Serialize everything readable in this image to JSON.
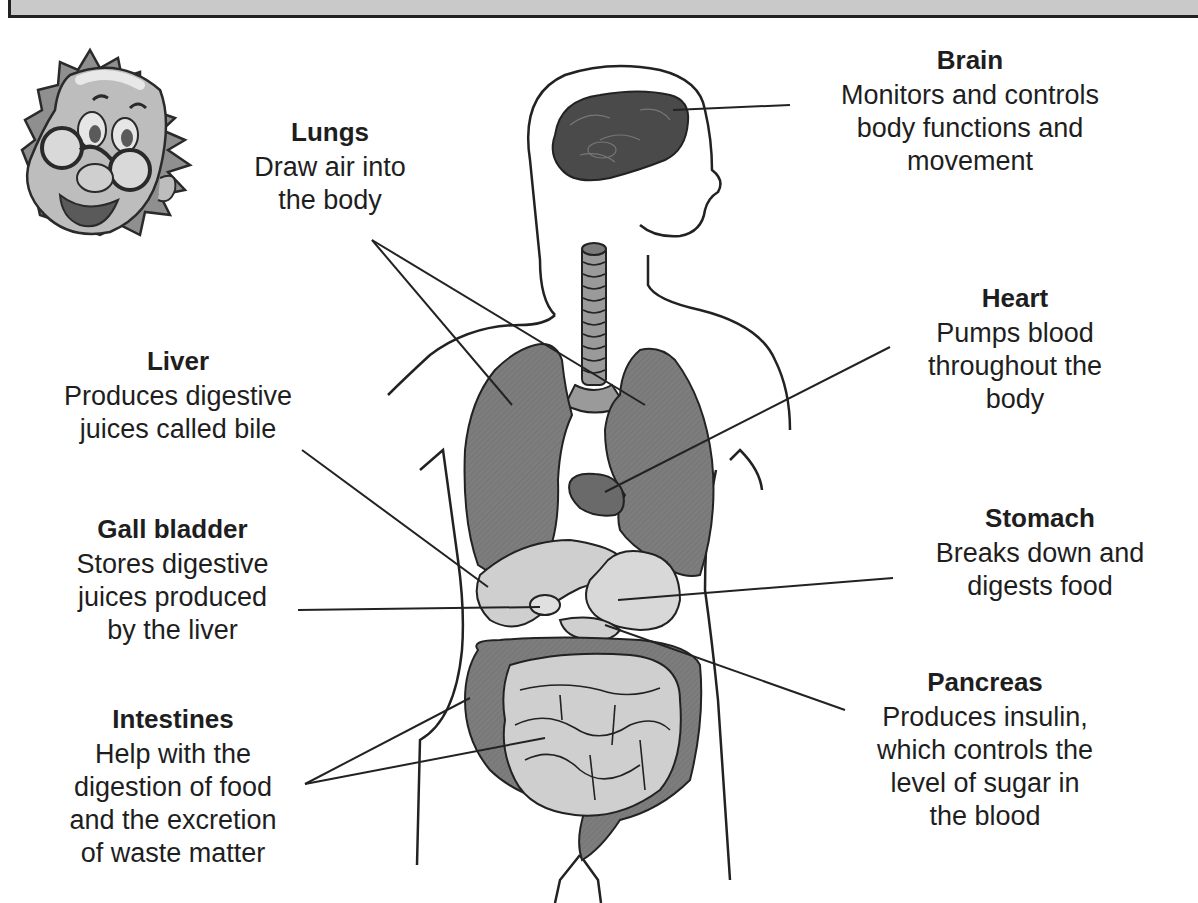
{
  "header": {
    "bar": ""
  },
  "mascot": {
    "name": "cartoon-professor-mascot"
  },
  "labels": {
    "brain": {
      "title": "Brain",
      "desc": "Monitors and controls\nbody functions and\nmovement"
    },
    "lungs": {
      "title": "Lungs",
      "desc": "Draw air into\nthe body"
    },
    "heart": {
      "title": "Heart",
      "desc": "Pumps blood\nthroughout the\nbody"
    },
    "liver": {
      "title": "Liver",
      "desc": "Produces digestive\njuices called bile"
    },
    "gall_bladder": {
      "title": "Gall bladder",
      "desc": "Stores digestive\njuices produced\nby the liver"
    },
    "stomach": {
      "title": "Stomach",
      "desc": "Breaks down and\ndigests food"
    },
    "intestines": {
      "title": "Intestines",
      "desc": "Help with the\ndigestion of food\nand the excretion\nof waste matter"
    },
    "pancreas": {
      "title": "Pancreas",
      "desc": "Produces insulin,\nwhich controls the\nlevel of sugar in\nthe blood"
    }
  },
  "colors": {
    "header_bg": "#c9c9c9",
    "lung_fill": "#7a7a7a",
    "brain_fill": "#4a4a4a",
    "organ_light": "#cfcfcf",
    "organ_mid": "#8c8c8c",
    "outline": "#222222"
  }
}
